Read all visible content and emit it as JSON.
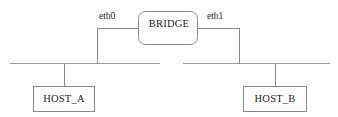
{
  "diagram": {
    "type": "network-topology",
    "title": "",
    "background_color": "#ffffff",
    "line_color": "#8a8a8a",
    "text_color": "#1c1c1c",
    "nodes": {
      "bridge": {
        "label": "BRIDGE",
        "shape": "rounded-rectangle",
        "x": 138,
        "y": 11,
        "width": 60,
        "height": 34
      },
      "host_a": {
        "label": "HOST_A",
        "shape": "rectangle",
        "x": 33,
        "y": 86,
        "width": 62,
        "height": 26
      },
      "host_b": {
        "label": "HOST_B",
        "shape": "rectangle",
        "x": 243,
        "y": 86,
        "width": 64,
        "height": 26
      }
    },
    "interfaces": [
      {
        "name": "eth0",
        "label": "eth0",
        "side": "left",
        "connects_bridge_to": "left-bus"
      },
      {
        "name": "eth1",
        "label": "eth1",
        "side": "right",
        "connects_bridge_to": "right-bus"
      }
    ],
    "buses": [
      {
        "name": "left-segment",
        "y": 63,
        "x_start": 10,
        "x_end": 160,
        "attached_nodes": [
          "host_a",
          "eth0"
        ]
      },
      {
        "name": "right-segment",
        "y": 63,
        "x_start": 183,
        "x_end": 330,
        "attached_nodes": [
          "host_b",
          "eth1"
        ]
      }
    ],
    "links": [
      {
        "name": "eth0-riser",
        "from": "bridge-left",
        "to": "left-segment",
        "x": 97
      },
      {
        "name": "eth1-riser",
        "from": "bridge-right",
        "to": "right-segment",
        "x": 239
      },
      {
        "name": "host-a-drop",
        "from": "left-segment",
        "to": "host_a",
        "x": 64
      },
      {
        "name": "host-b-drop",
        "from": "right-segment",
        "to": "host_b",
        "x": 275
      }
    ]
  }
}
